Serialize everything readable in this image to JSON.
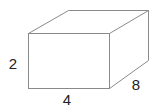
{
  "figure": {
    "type": "rectangular-prism",
    "labels": {
      "height": "2",
      "width": "4",
      "depth": "8"
    },
    "colors": {
      "edge": "#8a8a8a",
      "text": "#222222",
      "background": "#ffffff"
    }
  }
}
